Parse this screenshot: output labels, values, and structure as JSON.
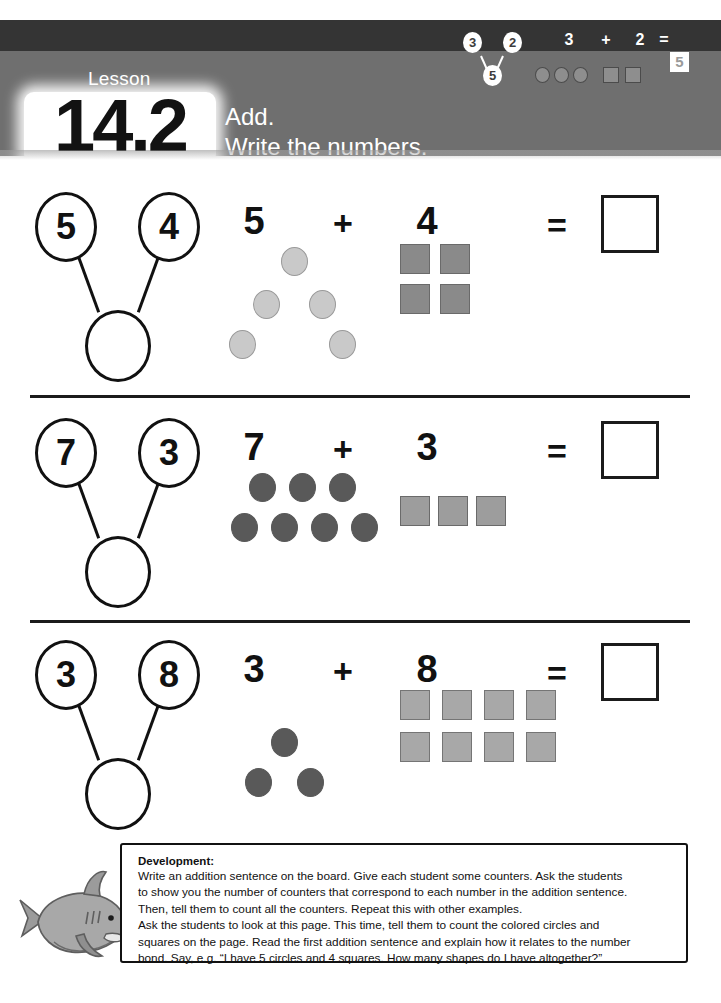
{
  "header": {
    "lesson_label": "Lesson",
    "lesson_number": "14.2",
    "instruction_line1": "Add.",
    "instruction_line2": "Write the numbers.",
    "example": {
      "bond_left": "3",
      "bond_right": "2",
      "bond_sum": "5",
      "addend1": "3",
      "operator": "+",
      "addend2": "2",
      "equals": "=",
      "answer": "5",
      "circle_count": 3,
      "square_count": 2
    },
    "colors": {
      "band_dark": "#343434",
      "band_light": "#6f6f6f",
      "text": "#ffffff"
    }
  },
  "problems": [
    {
      "bond_left": "5",
      "bond_right": "4",
      "bond_sum": "",
      "addend1": "5",
      "operator": "+",
      "addend2": "4",
      "equals": "=",
      "answer": "",
      "circle_count": 5,
      "square_count": 4,
      "circle_color": "#c9c9c9",
      "circle_border": "#9a9a9a",
      "square_color": "#8a8a8a",
      "square_border": "#6a6a6a"
    },
    {
      "bond_left": "7",
      "bond_right": "3",
      "bond_sum": "",
      "addend1": "7",
      "operator": "+",
      "addend2": "3",
      "equals": "=",
      "answer": "",
      "circle_count": 7,
      "square_count": 3,
      "circle_color": "#595959",
      "circle_border": "#595959",
      "square_color": "#9d9d9d",
      "square_border": "#6a6a6a"
    },
    {
      "bond_left": "3",
      "bond_right": "8",
      "bond_sum": "",
      "addend1": "3",
      "operator": "+",
      "addend2": "8",
      "equals": "=",
      "answer": "",
      "circle_count": 3,
      "square_count": 8,
      "circle_color": "#595959",
      "circle_border": "#595959",
      "square_color": "#a8a8a8",
      "square_border": "#757575"
    }
  ],
  "development": {
    "title": "Development:",
    "lines": [
      "Write an addition sentence on the board. Give each student some counters. Ask the students",
      "to show you the number of counters that correspond to each number in the addition sentence.",
      "Then, tell them to count all the counters. Repeat this with other examples.",
      "Ask the students to look at this page. This time, tell them to count the colored circles and",
      "squares on the page. Read the first addition sentence and explain how it relates to the number",
      "bond. Say, e.g. “I have 5 circles and 4 squares. How many shapes do I have altogether?”"
    ]
  },
  "decoration": {
    "mascot": "shark-illustration"
  }
}
